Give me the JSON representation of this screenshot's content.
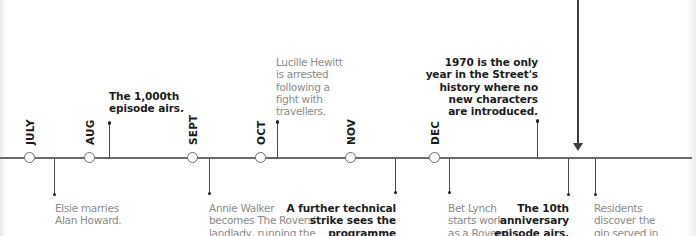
{
  "diagram": {
    "type": "timeline",
    "colors": {
      "line": "#6b6b6b",
      "month_label": "#1a1a1a",
      "event_bold": "#1c1c1c",
      "event_light": "#8a8a8a"
    },
    "months": [
      {
        "label": "JULY"
      },
      {
        "label": "AUG"
      },
      {
        "label": "SEPT"
      },
      {
        "label": "OCT"
      },
      {
        "label": "NOV"
      },
      {
        "label": "DEC"
      }
    ],
    "events_above": [
      {
        "lines": [
          "The 1,000th",
          "episode airs."
        ],
        "style": "bold"
      },
      {
        "lines": [
          "Lucille Hewitt",
          "is arrested",
          "following a",
          "fight with",
          "travellers."
        ],
        "style": "light"
      },
      {
        "lines": [
          "1970 is the only",
          "year in the Street's",
          "history where no",
          "new characters",
          "are introduced."
        ],
        "style": "bold"
      }
    ],
    "events_below": [
      {
        "lines": [
          "Elsie marries",
          "Alan Howard."
        ],
        "style": "light"
      },
      {
        "lines": [
          "Annie Walker",
          "becomes The Rovers'",
          "landlady, running the"
        ],
        "style": "light"
      },
      {
        "lines": [
          "A further technical",
          "strike sees the",
          "programme"
        ],
        "style": "bold"
      },
      {
        "lines": [
          "Bet Lynch",
          "starts work",
          "as a Rovers'"
        ],
        "style": "light"
      },
      {
        "lines": [
          "The 10th",
          "anniversary",
          "episode airs."
        ],
        "style": "bold"
      },
      {
        "lines": [
          "Residents",
          "discover the",
          "gin served in"
        ],
        "style": "light"
      }
    ],
    "pointer_arrow": {
      "direction": "down",
      "icon": "arrow-down-icon"
    }
  }
}
